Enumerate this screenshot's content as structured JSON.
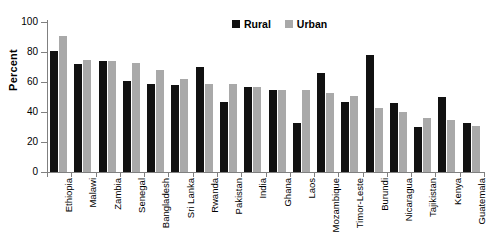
{
  "chart_data": {
    "type": "bar",
    "title": "",
    "xlabel": "",
    "ylabel": "Percent",
    "ylim": [
      0,
      100
    ],
    "yticks": [
      0,
      20,
      40,
      60,
      80,
      100
    ],
    "grid": false,
    "legend_position": "top-center",
    "categories": [
      "Ethiopia",
      "Malawi",
      "Zambia",
      "Senegal",
      "Bangladesh",
      "Sri Lanka",
      "Rwanda",
      "Pakistan",
      "India",
      "Ghana",
      "Laos",
      "Mozambique",
      "Timor-Leste",
      "Burundi",
      "Nicaragua",
      "Tajikistan",
      "Kenya",
      "Guatemala"
    ],
    "series": [
      {
        "name": "Rural",
        "color": "#111111",
        "values": [
          81,
          72,
          74,
          61,
          59,
          58,
          70,
          47,
          57,
          55,
          33,
          66,
          47,
          78,
          46,
          30,
          50,
          33
        ]
      },
      {
        "name": "Urban",
        "color": "#a9a9a9",
        "values": [
          91,
          75,
          74,
          73,
          68,
          62,
          59,
          59,
          57,
          55,
          55,
          53,
          51,
          43,
          40,
          36,
          35,
          31
        ]
      }
    ]
  }
}
